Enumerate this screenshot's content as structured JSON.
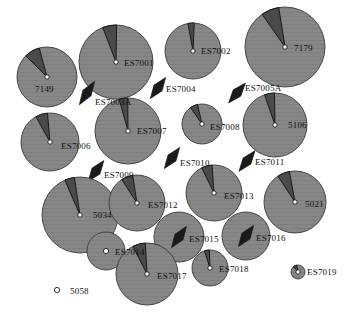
{
  "figure": {
    "title": "",
    "type": "station-symbol-map",
    "width": 350,
    "height": 317,
    "background": "#ffffff"
  },
  "style": {
    "disc_fill": "#878787",
    "disc_stroke": "#3a3a3a",
    "wedge_fill": "#4a4a4a",
    "wedge_stroke": "#1a1a1a",
    "arrow_fill": "#1a1a1a",
    "center_ring_stroke": "#1a1a1a",
    "center_ring_fill": "#ffffff",
    "label_color": "#111111",
    "hatch_color": "#9a9a9a"
  },
  "symbol_legend": {
    "disc": "filled grey circle whose radius scales with station magnitude",
    "wedge": "dark pie wedge showing principal azimuth sector",
    "arrow": "double-headed arrow showing bi-directional axis",
    "ring": "small open circle marking the station point",
    "point_only": "stations drawn as a bare open circle (no disc)"
  },
  "stations": [
    {
      "id": "7149",
      "label": "7149",
      "cx": 47,
      "cy": 77,
      "r": 30,
      "marker": "disc-wedge",
      "wedge_center_deg": 330,
      "wedge_width_deg": 30,
      "wedge_r": 30,
      "label_x": 35,
      "label_y": 89,
      "label_anchor": "start"
    },
    {
      "id": "ES7001",
      "label": "ES7001",
      "cx": 116,
      "cy": 62,
      "r": 37,
      "marker": "disc-wedge",
      "wedge_center_deg": 350,
      "wedge_width_deg": 22,
      "wedge_r": 37,
      "label_x": 124,
      "label_y": 63,
      "label_anchor": "start"
    },
    {
      "id": "ES7002",
      "label": "ES7002",
      "cx": 193,
      "cy": 51,
      "r": 28,
      "marker": "disc-wedge",
      "wedge_center_deg": 356,
      "wedge_width_deg": 13,
      "wedge_r": 28,
      "label_x": 201,
      "label_y": 51,
      "label_anchor": "start"
    },
    {
      "id": "7179",
      "label": "7179",
      "cx": 285,
      "cy": 47,
      "r": 40,
      "marker": "disc-wedge",
      "wedge_center_deg": 338,
      "wedge_width_deg": 26,
      "wedge_r": 40,
      "label_x": 294,
      "label_y": 48,
      "label_anchor": "start"
    },
    {
      "id": "ES7003A",
      "label": "ES7003A",
      "cx": 87,
      "cy": 93,
      "r": 0,
      "marker": "arrow",
      "arrow_deg": 33,
      "arrow_len": 14,
      "label_x": 95,
      "label_y": 102,
      "label_anchor": "start"
    },
    {
      "id": "ES7004",
      "label": "ES7004",
      "cx": 158,
      "cy": 88,
      "r": 0,
      "marker": "arrow",
      "arrow_deg": 36,
      "arrow_len": 13,
      "label_x": 166,
      "label_y": 89,
      "label_anchor": "start"
    },
    {
      "id": "ES7005A",
      "label": "ES7005A",
      "cx": 237,
      "cy": 93,
      "r": 0,
      "marker": "arrow",
      "arrow_deg": 40,
      "arrow_len": 13,
      "label_x": 245,
      "label_y": 88,
      "label_anchor": "start"
    },
    {
      "id": "ES7006",
      "label": "ES7006",
      "cx": 50,
      "cy": 142,
      "r": 29,
      "marker": "disc-wedge",
      "wedge_center_deg": 343,
      "wedge_width_deg": 24,
      "wedge_r": 29,
      "label_x": 61,
      "label_y": 146,
      "label_anchor": "start"
    },
    {
      "id": "ES7007",
      "label": "ES7007",
      "cx": 128,
      "cy": 131,
      "r": 33,
      "marker": "disc-wedge",
      "wedge_center_deg": 352,
      "wedge_width_deg": 15,
      "wedge_r": 33,
      "label_x": 137,
      "label_y": 131,
      "label_anchor": "start"
    },
    {
      "id": "ES7008",
      "label": "ES7008",
      "cx": 202,
      "cy": 124,
      "r": 20,
      "marker": "disc-wedge",
      "wedge_center_deg": 336,
      "wedge_width_deg": 22,
      "wedge_r": 20,
      "label_x": 210,
      "label_y": 127,
      "label_anchor": "start"
    },
    {
      "id": "5106",
      "label": "5106",
      "cx": 275,
      "cy": 125,
      "r": 32,
      "marker": "disc-wedge",
      "wedge_center_deg": 350,
      "wedge_width_deg": 18,
      "wedge_r": 32,
      "label_x": 288,
      "label_y": 125,
      "label_anchor": "start"
    },
    {
      "id": "ES7009",
      "label": "ES7009",
      "cx": 96,
      "cy": 171,
      "r": 0,
      "marker": "arrow",
      "arrow_deg": 37,
      "arrow_len": 13,
      "label_x": 104,
      "label_y": 175,
      "label_anchor": "start"
    },
    {
      "id": "ES7010",
      "label": "ES7010",
      "cx": 172,
      "cy": 158,
      "r": 0,
      "marker": "arrow",
      "arrow_deg": 36,
      "arrow_len": 13,
      "label_x": 180,
      "label_y": 163,
      "label_anchor": "start"
    },
    {
      "id": "ES7011",
      "label": "ES7011",
      "cx": 247,
      "cy": 161,
      "r": 0,
      "marker": "arrow",
      "arrow_deg": 38,
      "arrow_len": 13,
      "label_x": 255,
      "label_y": 162,
      "label_anchor": "start"
    },
    {
      "id": "5034",
      "label": "5034",
      "cx": 80,
      "cy": 215,
      "r": 38,
      "marker": "disc-wedge",
      "wedge_center_deg": 344,
      "wedge_width_deg": 15,
      "wedge_r": 38,
      "label_x": 93,
      "label_y": 215,
      "label_anchor": "start"
    },
    {
      "id": "ES7012",
      "label": "ES7012",
      "cx": 137,
      "cy": 203,
      "r": 28,
      "marker": "disc-wedge",
      "wedge_center_deg": 339,
      "wedge_width_deg": 24,
      "wedge_r": 28,
      "label_x": 148,
      "label_y": 205,
      "label_anchor": "start"
    },
    {
      "id": "ES7013",
      "label": "ES7013",
      "cx": 214,
      "cy": 193,
      "r": 28,
      "marker": "disc-wedge",
      "wedge_center_deg": 345,
      "wedge_width_deg": 22,
      "wedge_r": 28,
      "label_x": 224,
      "label_y": 196,
      "label_anchor": "start"
    },
    {
      "id": "5021",
      "label": "5021",
      "cx": 295,
      "cy": 202,
      "r": 31,
      "marker": "disc-wedge",
      "wedge_center_deg": 338,
      "wedge_width_deg": 23,
      "wedge_r": 31,
      "label_x": 305,
      "label_y": 204,
      "label_anchor": "start"
    },
    {
      "id": "ES7014",
      "label": "ES7014",
      "cx": 106,
      "cy": 251,
      "r": 19,
      "marker": "disc-ring",
      "label_x": 115,
      "label_y": 252,
      "label_anchor": "start"
    },
    {
      "id": "ES7015",
      "label": "ES7015",
      "cx": 179,
      "cy": 237,
      "r": 25,
      "marker": "disc-arrow",
      "arrow_deg": 35,
      "arrow_len": 13,
      "label_x": 189,
      "label_y": 239,
      "label_anchor": "start"
    },
    {
      "id": "ES7016",
      "label": "ES7016",
      "cx": 246,
      "cy": 236,
      "r": 24,
      "marker": "disc-arrow",
      "arrow_deg": 36,
      "arrow_len": 13,
      "label_x": 256,
      "label_y": 238,
      "label_anchor": "start"
    },
    {
      "id": "ES7017",
      "label": "ES7017",
      "cx": 147,
      "cy": 274,
      "r": 31,
      "marker": "disc-wedge",
      "wedge_center_deg": 345,
      "wedge_width_deg": 24,
      "wedge_r": 31,
      "label_x": 157,
      "label_y": 276,
      "label_anchor": "start"
    },
    {
      "id": "ES7018",
      "label": "ES7018",
      "cx": 210,
      "cy": 268,
      "r": 18,
      "marker": "disc-wedge",
      "wedge_center_deg": 350,
      "wedge_width_deg": 16,
      "wedge_r": 18,
      "label_x": 219,
      "label_y": 269,
      "label_anchor": "start"
    },
    {
      "id": "ES7019",
      "label": "ES7019",
      "cx": 298,
      "cy": 272,
      "r": 7,
      "marker": "disc-wedge",
      "wedge_center_deg": 335,
      "wedge_width_deg": 30,
      "wedge_r": 7,
      "label_x": 307,
      "label_y": 272,
      "label_anchor": "start"
    },
    {
      "id": "5058",
      "label": "5058",
      "cx": 57,
      "cy": 290,
      "r": 0,
      "marker": "ring",
      "label_x": 70,
      "label_y": 291,
      "label_anchor": "start"
    }
  ]
}
